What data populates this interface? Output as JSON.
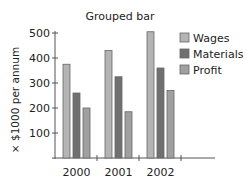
{
  "chart_data": {
    "type": "bar",
    "title": "Grouped bar",
    "xlabel": "",
    "ylabel": "× $1000 per annum",
    "categories": [
      "2000",
      "2001",
      "2002"
    ],
    "series": [
      {
        "name": "Wages",
        "values": [
          375,
          430,
          505
        ],
        "color": "#b4b4b4"
      },
      {
        "name": "Materials",
        "values": [
          260,
          325,
          360
        ],
        "color": "#707070"
      },
      {
        "name": "Profit",
        "values": [
          200,
          185,
          270
        ],
        "color": "#a0a0a0"
      }
    ],
    "ylim": [
      0,
      500
    ],
    "yticks": [
      100,
      200,
      300,
      400,
      500
    ],
    "ytick_labels": [
      "100",
      "200",
      "300",
      "400",
      "500"
    ],
    "grid": false,
    "legend_position": "top-right"
  }
}
